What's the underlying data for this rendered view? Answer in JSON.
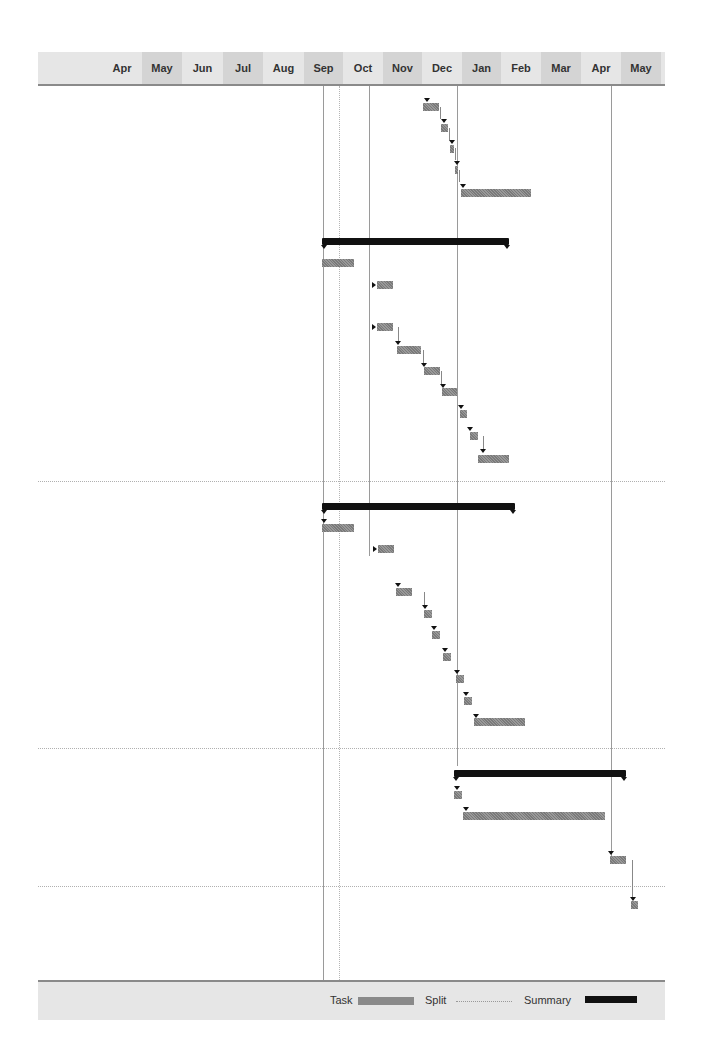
{
  "timeline": {
    "months": [
      {
        "label": "Apr",
        "left": 64,
        "width": 40,
        "shade": false
      },
      {
        "label": "May",
        "left": 104,
        "width": 40,
        "shade": true
      },
      {
        "label": "Jun",
        "left": 144,
        "width": 41,
        "shade": false
      },
      {
        "label": "Jul",
        "left": 185,
        "width": 40,
        "shade": true
      },
      {
        "label": "Aug",
        "left": 225,
        "width": 41,
        "shade": false
      },
      {
        "label": "Sep",
        "left": 266,
        "width": 39,
        "shade": true
      },
      {
        "label": "Oct",
        "left": 305,
        "width": 40,
        "shade": false
      },
      {
        "label": "Nov",
        "left": 345,
        "width": 39,
        "shade": true
      },
      {
        "label": "Dec",
        "left": 384,
        "width": 40,
        "shade": false
      },
      {
        "label": "Jan",
        "left": 424,
        "width": 39,
        "shade": true
      },
      {
        "label": "Feb",
        "left": 463,
        "width": 40,
        "shade": false
      },
      {
        "label": "Mar",
        "left": 503,
        "width": 40,
        "shade": true
      },
      {
        "label": "Apr",
        "left": 543,
        "width": 40,
        "shade": false
      },
      {
        "label": "May",
        "left": 583,
        "width": 40,
        "shade": true
      }
    ]
  },
  "legend": {
    "task_label": "Task",
    "split_label": "Split",
    "summary_label": "Summary"
  },
  "colors": {
    "task": "#8a8a8a",
    "summary": "#111111",
    "header_bg": "#e6e6e6"
  }
}
